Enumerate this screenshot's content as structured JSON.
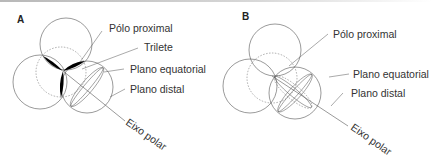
{
  "panels": [
    {
      "id": "A",
      "label": "A",
      "annotations": {
        "proximal_pole": "Pólo proximal",
        "trilete": "Trilete",
        "equatorial_plane": "Plano equatorial",
        "distal_plane": "Plano distal",
        "polar_axis": "Eixo polar"
      }
    },
    {
      "id": "B",
      "label": "B",
      "annotations": {
        "proximal_pole": "Pólo proximal",
        "equatorial_plane": "Plano equatorial",
        "distal_plane": "Plano distal",
        "polar_axis": "Eixo polar"
      }
    }
  ],
  "colors": {
    "line": "#555555",
    "fill": "#000000",
    "text": "#333333"
  }
}
